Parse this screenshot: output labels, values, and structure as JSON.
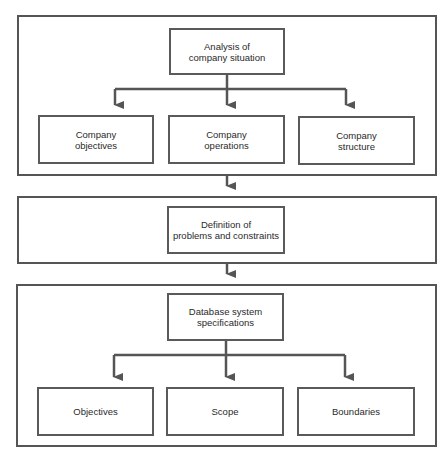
{
  "diagram": {
    "type": "flowchart",
    "colors": {
      "stroke": "#555555",
      "text": "#2a2a2a",
      "background": "#ffffff"
    },
    "stages": [
      {
        "id": "stage-1",
        "parent": "Analysis of\ncompany situation",
        "children": [
          "Company\nobjectives",
          "Company\noperations",
          "Company\nstructure"
        ]
      },
      {
        "id": "stage-2",
        "parent": "Definition of\nproblems and constraints",
        "children": []
      },
      {
        "id": "stage-3",
        "parent": "Database system\nspecifications",
        "children": [
          "Objectives",
          "Scope",
          "Boundaries"
        ]
      }
    ],
    "flow": [
      "stage-1 → stage-2",
      "stage-2 → stage-3"
    ]
  }
}
